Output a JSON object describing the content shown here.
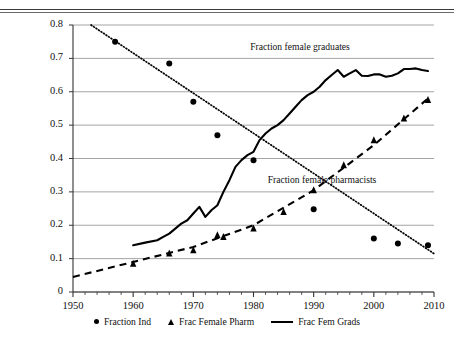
{
  "figure": {
    "cropped_header_text": "",
    "annotations": [
      {
        "text": "Fraction female graduates",
        "x": 300,
        "y": 41
      },
      {
        "text": "Fraction female pharmacists",
        "x": 322,
        "y": 174
      }
    ]
  },
  "legend": {
    "position": "bottom-center",
    "items": [
      {
        "label": "Fraction Ind",
        "marker": "circle-marker-icon"
      },
      {
        "label": "Frac Female Pharm",
        "marker": "triangle-marker-icon"
      },
      {
        "label": "Frac Fem Grads",
        "marker": "solid-line-marker-icon"
      }
    ]
  },
  "chart_data": {
    "type": "scatter",
    "title": "",
    "xlabel": "",
    "ylabel": "",
    "xlim": [
      1950,
      2010
    ],
    "ylim": [
      0,
      0.8
    ],
    "grid": true,
    "xticks": [
      1950,
      1960,
      1970,
      1980,
      1990,
      2000,
      2010
    ],
    "xtick_labels": [
      "1950",
      "1960",
      "1970",
      "1980",
      "1990",
      "2000",
      "2010"
    ],
    "xminor_tick_step": 2,
    "yticks": [
      0,
      0.1,
      0.2,
      0.3,
      0.4,
      0.5,
      0.6,
      0.7,
      0.8
    ],
    "ytick_labels": [
      "0",
      "0.1",
      "0.2",
      "0.3",
      "0.4",
      "0.5",
      "0.6",
      "0.7",
      "0.8"
    ],
    "series": [
      {
        "name": "Fraction Ind",
        "style": "markers+dotted-trend",
        "marker": "circle",
        "color": "#000000",
        "x": [
          1957,
          1966,
          1970,
          1974,
          1980,
          1990,
          2000,
          2004,
          2009
        ],
        "y": [
          0.75,
          0.685,
          0.57,
          0.47,
          0.395,
          0.248,
          0.16,
          0.145,
          0.14
        ],
        "trend_x": [
          1953,
          2010
        ],
        "trend_y": [
          0.8,
          0.115
        ]
      },
      {
        "name": "Frac Female Pharm",
        "style": "markers+dashed-trend",
        "marker": "triangle",
        "color": "#000000",
        "x": [
          1960,
          1966,
          1970,
          1974,
          1975,
          1980,
          1985,
          1990,
          1995,
          2000,
          2005,
          2009
        ],
        "y": [
          0.085,
          0.115,
          0.125,
          0.17,
          0.165,
          0.19,
          0.24,
          0.305,
          0.38,
          0.455,
          0.52,
          0.575
        ],
        "trend_x": [
          1950,
          1960,
          1970,
          1980,
          1990,
          2000,
          2009
        ],
        "trend_y": [
          0.045,
          0.09,
          0.135,
          0.2,
          0.305,
          0.44,
          0.58
        ]
      },
      {
        "name": "Frac Fem Grads",
        "style": "solid-line",
        "color": "#000000",
        "x": [
          1960,
          1962,
          1964,
          1965,
          1966,
          1967,
          1968,
          1969,
          1970,
          1971,
          1972,
          1973,
          1974,
          1975,
          1976,
          1977,
          1978,
          1979,
          1980,
          1981,
          1982,
          1983,
          1984,
          1985,
          1986,
          1987,
          1988,
          1989,
          1990,
          1991,
          1992,
          1993,
          1994,
          1995,
          1996,
          1997,
          1998,
          1999,
          2000,
          2001,
          2002,
          2003,
          2004,
          2005,
          2006,
          2007,
          2008,
          2009
        ],
        "y": [
          0.14,
          0.148,
          0.155,
          0.165,
          0.175,
          0.19,
          0.205,
          0.215,
          0.235,
          0.255,
          0.225,
          0.245,
          0.26,
          0.3,
          0.335,
          0.375,
          0.395,
          0.41,
          0.42,
          0.455,
          0.475,
          0.49,
          0.5,
          0.515,
          0.535,
          0.555,
          0.575,
          0.59,
          0.6,
          0.615,
          0.635,
          0.65,
          0.665,
          0.645,
          0.655,
          0.665,
          0.648,
          0.647,
          0.652,
          0.652,
          0.645,
          0.648,
          0.655,
          0.668,
          0.668,
          0.67,
          0.665,
          0.662
        ]
      }
    ]
  }
}
